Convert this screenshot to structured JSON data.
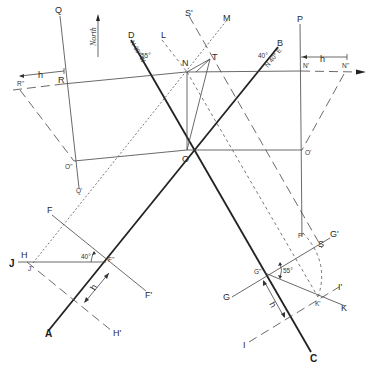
{
  "figure": {
    "north_label": "North",
    "points": {
      "A": "A",
      "B": "B",
      "C": "C",
      "D": "D",
      "O": "O",
      "O_prime": "O'",
      "O_dprime": "O''",
      "N": "N",
      "N_prime": "N'",
      "N_dprime": "N''",
      "P": "P",
      "P_prime": "P'",
      "Q": "Q",
      "Q_prime": "Q'",
      "R": "R",
      "R_dprime": "R''",
      "L": "L",
      "M": "M",
      "S_prime": "S'",
      "T": "T",
      "F": "F",
      "F_prime": "F'",
      "F_dprime": "F''",
      "H": "H",
      "H_prime": "H'",
      "J": "J",
      "J_prime": "J'",
      "G": "G",
      "G_prime": "G'",
      "G_dprime": "G''",
      "I": "I",
      "I_prime": "I'",
      "K": "K",
      "K_prime": "K'",
      "S": "S"
    },
    "annotations": {
      "strike_ab": "N 40° E",
      "angle_ab": "40°",
      "strike_dc": "N 30° W",
      "angle_dc": "55°",
      "angle_f": "40°",
      "angle_g": "55°",
      "h": "h"
    }
  }
}
